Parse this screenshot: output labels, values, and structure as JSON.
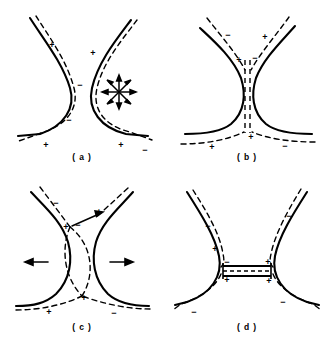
{
  "figure": {
    "background_color": "#ffffff",
    "line_color": "#000000",
    "panel_count": 4,
    "layout": "2x2 grid"
  },
  "panels": [
    {
      "id": "a",
      "label": "( a )",
      "caption_text": "( a )",
      "description": "Hyperbolic neck with solid separatrix arms and nearly-parallel dashed perturbed field lines; radial arrow star at right.",
      "signs": [
        {
          "symbol": "+",
          "x": 52,
          "y": 45
        },
        {
          "symbol": "+",
          "x": 93,
          "y": 53
        },
        {
          "symbol": "−",
          "x": 80,
          "y": 85
        },
        {
          "symbol": "−",
          "x": 69,
          "y": 120
        },
        {
          "symbol": "+",
          "x": 46,
          "y": 145
        },
        {
          "symbol": "+",
          "x": 121,
          "y": 145
        },
        {
          "symbol": "−",
          "x": 145,
          "y": 150
        }
      ],
      "arrows": [],
      "star": {
        "present": true,
        "cx": 119,
        "cy": 92,
        "rays": 8,
        "radius": 15
      },
      "has_current_sheet": false
    },
    {
      "id": "b",
      "label": "( b )",
      "caption_text": "( b )",
      "description": "Neck pinched into a thin vertical dashed current sheet; arms splay outward at top and bottom.",
      "signs": [
        {
          "symbol": "−",
          "x": 63,
          "y": 35
        },
        {
          "symbol": "+",
          "x": 100,
          "y": 37
        },
        {
          "symbol": "+",
          "x": 76,
          "y": 60
        },
        {
          "symbol": "−",
          "x": 88,
          "y": 58
        },
        {
          "symbol": "+",
          "x": 85,
          "y": 137
        },
        {
          "symbol": "+",
          "x": 47,
          "y": 147
        },
        {
          "symbol": "−",
          "x": 120,
          "y": 146
        }
      ],
      "arrows": [],
      "star": {
        "present": false
      },
      "has_current_sheet": true,
      "current_sheet_orientation": "vertical"
    },
    {
      "id": "c",
      "label": "( c )",
      "caption_text": "( c )",
      "description": "Dashed field lines cross in an X / lens configuration; bulk outflow arrows point left and right.",
      "signs": [
        {
          "symbol": "−",
          "x": 56,
          "y": 33
        },
        {
          "symbol": "+",
          "x": 99,
          "y": 42
        },
        {
          "symbol": "+",
          "x": 67,
          "y": 57
        },
        {
          "symbol": "−",
          "x": 77,
          "y": 55
        },
        {
          "symbol": "+",
          "x": 83,
          "y": 127
        },
        {
          "symbol": "+",
          "x": 49,
          "y": 142
        },
        {
          "symbol": "−",
          "x": 114,
          "y": 143
        }
      ],
      "arrows": [
        {
          "direction": "left",
          "x1": 48,
          "y1": 92,
          "x2": 27,
          "y2": 92
        },
        {
          "direction": "right",
          "x1": 108,
          "y1": 92,
          "x2": 131,
          "y2": 92
        }
      ],
      "star": {
        "present": false
      },
      "has_current_sheet": false
    },
    {
      "id": "d",
      "label": "( d )",
      "caption_text": "( d )",
      "description": "Elongated horizontal current sheet at the centre bridging the two separatrix lobes.",
      "signs": [
        {
          "symbol": "−",
          "x": 43,
          "y": 56
        },
        {
          "symbol": "−",
          "x": 124,
          "y": 46
        },
        {
          "symbol": "+",
          "x": 52,
          "y": 78
        },
        {
          "symbol": "−",
          "x": 61,
          "y": 93
        },
        {
          "symbol": "+",
          "x": 104,
          "y": 91
        },
        {
          "symbol": "+",
          "x": 62,
          "y": 106
        },
        {
          "symbol": "+",
          "x": 104,
          "y": 107
        },
        {
          "symbol": "−",
          "x": 118,
          "y": 132
        },
        {
          "symbol": "−",
          "x": 29,
          "y": 142
        }
      ],
      "arrows": [],
      "star": {
        "present": false
      },
      "has_current_sheet": true,
      "current_sheet_orientation": "horizontal"
    }
  ]
}
